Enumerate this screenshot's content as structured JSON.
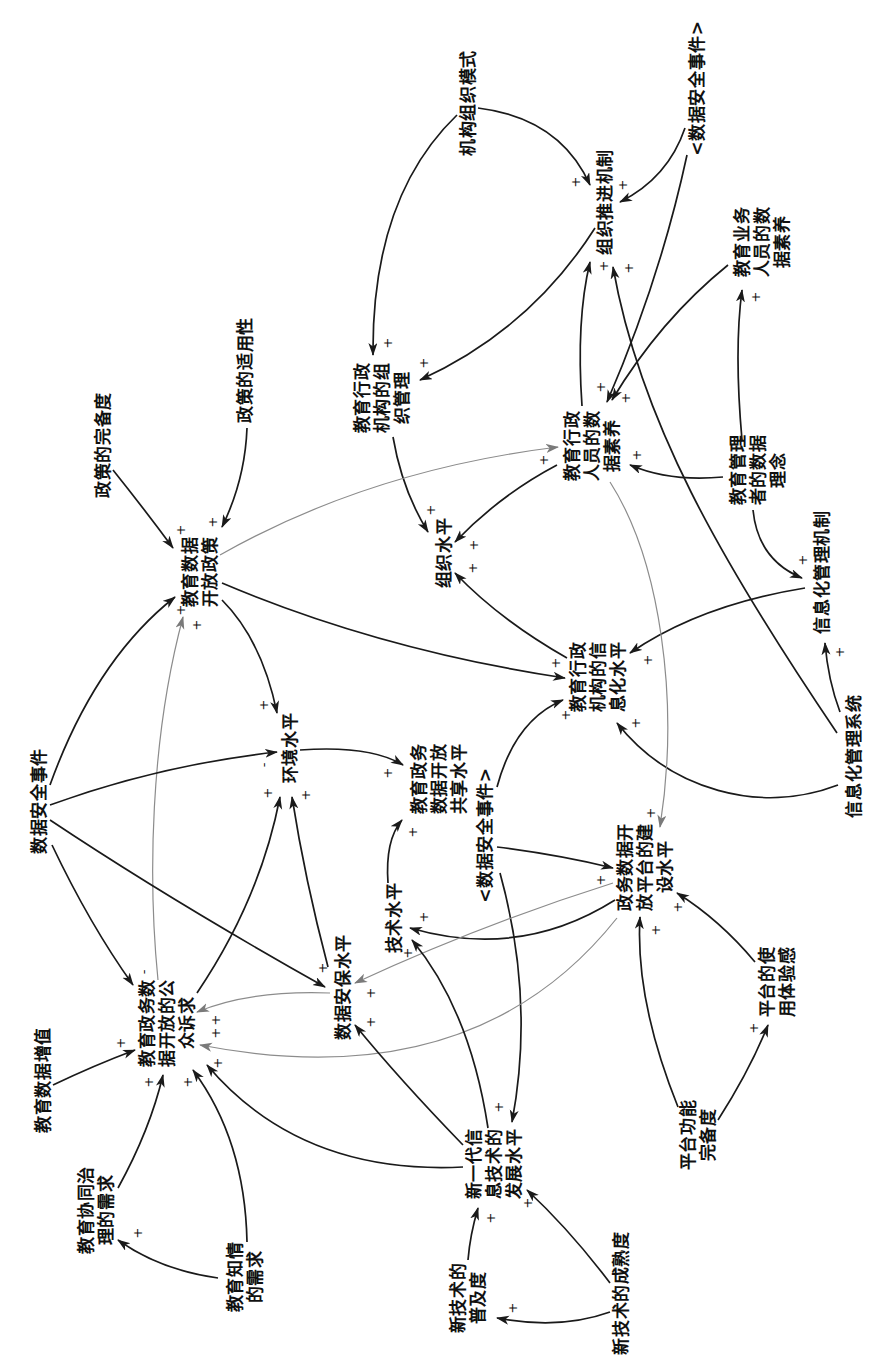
{
  "colors": {
    "background": "#ffffff",
    "text": "#111111",
    "link_primary": "#1a1a1a",
    "link_secondary": "#8c8c8c"
  },
  "diagram": {
    "nodes": [
      {
        "label": "机构组织模式",
        "lines": [
          "机构组织模式"
        ]
      },
      {
        "label": "<数据安全事件>",
        "lines": [
          "<数据安全事件>"
        ]
      },
      {
        "label": "组织推进机制",
        "lines": [
          "组织推进机制"
        ]
      },
      {
        "label": "教育业务人员的数据素养",
        "lines": [
          "教育业务",
          "人员的数",
          "据素养"
        ]
      },
      {
        "label": "教育行政机构的组织管理",
        "lines": [
          "教育行政",
          "机构的组",
          "织管理"
        ]
      },
      {
        "label": "教育行政人员的数据素养",
        "lines": [
          "教育行政",
          "人员的数",
          "据素养"
        ]
      },
      {
        "label": "教育管理者的数据理念",
        "lines": [
          "教育管理",
          "者的数据",
          "理念"
        ]
      },
      {
        "label": "政策的适用性",
        "lines": [
          "政策的适用性"
        ]
      },
      {
        "label": "政策的完备度",
        "lines": [
          "政策的完备度"
        ]
      },
      {
        "label": "教育数据开放政策",
        "lines": [
          "教育数据",
          "开放政策"
        ]
      },
      {
        "label": "组织水平",
        "lines": [
          "组织水平"
        ]
      },
      {
        "label": "信息化管理机制",
        "lines": [
          "信息化管理机制"
        ]
      },
      {
        "label": "教育行政机构的信息化水平",
        "lines": [
          "教育行政",
          "机构的信",
          "息化水平"
        ]
      },
      {
        "label": "信息化管理系统",
        "lines": [
          "信息化管理系统"
        ]
      },
      {
        "label": "数据安全事件",
        "lines": [
          "数据安全事件"
        ]
      },
      {
        "label": "环境水平",
        "lines": [
          "环境水平"
        ]
      },
      {
        "label": "教育政务数据开放共享水平",
        "lines": [
          "教育政务",
          "数据开放",
          "共享水平"
        ]
      },
      {
        "label": "<数据安全事件>",
        "lines": [
          "<数据安全事件>"
        ]
      },
      {
        "label": "政务数据开放平台的建设水平",
        "lines": [
          "政务数据开",
          "放平台的建",
          "设水平"
        ]
      },
      {
        "label": "技术水平",
        "lines": [
          "技术水平"
        ]
      },
      {
        "label": "数据安保水平",
        "lines": [
          "数据安保水平"
        ]
      },
      {
        "label": "教育政务数据开放的公众诉求",
        "lines": [
          "教育政务数",
          "据开放的公",
          "众诉求"
        ]
      },
      {
        "label": "教育数据增值",
        "lines": [
          "教育数据增值"
        ]
      },
      {
        "label": "教育协同治理的需求",
        "lines": [
          "教育协同治",
          "理的需求"
        ]
      },
      {
        "label": "教育知情的需求",
        "lines": [
          "教育知情",
          "的需求"
        ]
      },
      {
        "label": "新一代信息技术的发展水平",
        "lines": [
          "新一代信",
          "息技术的",
          "发展水平"
        ]
      },
      {
        "label": "新技术的普及度",
        "lines": [
          "新技术的",
          "普及度"
        ]
      },
      {
        "label": "新技术的成熟度",
        "lines": [
          "新技术的成熟度"
        ]
      },
      {
        "label": "平台功能完备度",
        "lines": [
          "平台功能",
          "完备度"
        ]
      },
      {
        "label": "平台的使用体验感",
        "lines": [
          "平台的使",
          "用体验感"
        ]
      }
    ],
    "edges": [
      {
        "from": "机构组织模式",
        "to": "组织推进机制",
        "polarity": "+",
        "style": "black"
      },
      {
        "from": "机构组织模式",
        "to": "教育行政机构的组织管理",
        "polarity": "+",
        "style": "black"
      },
      {
        "from": "<数据安全事件>",
        "to": "组织推进机制",
        "polarity": "+",
        "style": "black"
      },
      {
        "from": "<数据安全事件>",
        "to": "教育行政人员的数据素养",
        "polarity": "+",
        "style": "black"
      },
      {
        "from": "组织推进机制",
        "to": "教育行政机构的组织管理",
        "polarity": "+",
        "style": "black"
      },
      {
        "from": "教育业务人员的数据素养",
        "to": "教育行政人员的数据素养",
        "polarity": "+",
        "style": "black"
      },
      {
        "from": "教育行政人员的数据素养",
        "to": "组织推进机制",
        "polarity": "+",
        "style": "black"
      },
      {
        "from": "信息化管理系统",
        "to": "组织推进机制",
        "polarity": "+",
        "style": "black"
      },
      {
        "from": "教育管理者的数据理念",
        "to": "教育业务人员的数据素养",
        "polarity": "+",
        "style": "black"
      },
      {
        "from": "教育管理者的数据理念",
        "to": "教育行政人员的数据素养",
        "polarity": "+",
        "style": "black"
      },
      {
        "from": "教育管理者的数据理念",
        "to": "信息化管理机制",
        "polarity": "+",
        "style": "black"
      },
      {
        "from": "信息化管理系统",
        "to": "信息化管理机制",
        "polarity": "+",
        "style": "black"
      },
      {
        "from": "信息化管理机制",
        "to": "教育行政机构的信息化水平",
        "polarity": "+",
        "style": "black"
      },
      {
        "from": "信息化管理系统",
        "to": "教育行政机构的信息化水平",
        "polarity": "+",
        "style": "black"
      },
      {
        "from": "教育行政机构的组织管理",
        "to": "组织水平",
        "polarity": "+",
        "style": "black"
      },
      {
        "from": "教育行政人员的数据素养",
        "to": "组织水平",
        "polarity": "+",
        "style": "black"
      },
      {
        "from": "教育行政机构的信息化水平",
        "to": "组织水平",
        "polarity": "+",
        "style": "black"
      },
      {
        "from": "教育数据开放政策",
        "to": "教育行政人员的数据素养",
        "polarity": "+",
        "style": "gray"
      },
      {
        "from": "教育数据开放政策",
        "to": "教育行政机构的信息化水平",
        "polarity": "+",
        "style": "black"
      },
      {
        "from": "教育数据开放政策",
        "to": "环境水平",
        "polarity": "+",
        "style": "black"
      },
      {
        "from": "政策的完备度",
        "to": "教育数据开放政策",
        "polarity": "+",
        "style": "black"
      },
      {
        "from": "政策的适用性",
        "to": "教育数据开放政策",
        "polarity": "+",
        "style": "black"
      },
      {
        "from": "数据安全事件",
        "to": "教育数据开放政策",
        "polarity": "+",
        "style": "black"
      },
      {
        "from": "教育政务数据开放的公众诉求",
        "to": "教育数据开放政策",
        "polarity": "+",
        "style": "gray"
      },
      {
        "from": "数据安全事件",
        "to": "环境水平",
        "polarity": "-",
        "style": "black"
      },
      {
        "from": "数据安全事件",
        "to": "数据安保水平",
        "polarity": "+",
        "style": "black"
      },
      {
        "from": "数据安全事件",
        "to": "教育政务数据开放的公众诉求",
        "polarity": "-",
        "style": "black"
      },
      {
        "from": "教育政务数据开放的公众诉求",
        "to": "环境水平",
        "polarity": "+",
        "style": "black"
      },
      {
        "from": "数据安保水平",
        "to": "环境水平",
        "polarity": "+",
        "style": "black"
      },
      {
        "from": "环境水平",
        "to": "教育政务数据开放共享水平",
        "polarity": "+",
        "style": "black"
      },
      {
        "from": "数据安保水平",
        "to": "教育政务数据开放的公众诉求",
        "polarity": "+",
        "style": "gray"
      },
      {
        "from": "技术水平",
        "to": "教育政务数据开放共享水平",
        "polarity": "+",
        "style": "black"
      },
      {
        "from": "<数据安全事件>",
        "to": "教育行政机构的信息化水平",
        "polarity": "+",
        "style": "black"
      },
      {
        "from": "<数据安全事件>",
        "to": "政务数据开放平台的建设水平",
        "polarity": "+",
        "style": "black"
      },
      {
        "from": "<数据安全事件>",
        "to": "新一代信息技术的发展水平",
        "polarity": "+",
        "style": "black"
      },
      {
        "from": "教育行政人员的数据素养",
        "to": "政务数据开放平台的建设水平",
        "polarity": "+",
        "style": "gray"
      },
      {
        "from": "政务数据开放平台的建设水平",
        "to": "技术水平",
        "polarity": "+",
        "style": "black"
      },
      {
        "from": "政务数据开放平台的建设水平",
        "to": "数据安保水平",
        "polarity": "+",
        "style": "gray"
      },
      {
        "from": "政务数据开放平台的建设水平",
        "to": "教育政务数据开放的公众诉求",
        "polarity": "+",
        "style": "gray"
      },
      {
        "from": "新一代信息技术的发展水平",
        "to": "技术水平",
        "polarity": "+",
        "style": "black"
      },
      {
        "from": "新一代信息技术的发展水平",
        "to": "数据安保水平",
        "polarity": "+",
        "style": "black"
      },
      {
        "from": "新一代信息技术的发展水平",
        "to": "教育政务数据开放的公众诉求",
        "polarity": "+",
        "style": "black"
      },
      {
        "from": "平台功能完备度",
        "to": "政务数据开放平台的建设水平",
        "polarity": "+",
        "style": "black"
      },
      {
        "from": "平台的使用体验感",
        "to": "政务数据开放平台的建设水平",
        "polarity": "+",
        "style": "black"
      },
      {
        "from": "平台功能完备度",
        "to": "平台的使用体验感",
        "polarity": "+",
        "style": "black"
      },
      {
        "from": "新技术的普及度",
        "to": "新一代信息技术的发展水平",
        "polarity": "+",
        "style": "black"
      },
      {
        "from": "新技术的成熟度",
        "to": "新一代信息技术的发展水平",
        "polarity": "+",
        "style": "black"
      },
      {
        "from": "新技术的成熟度",
        "to": "新技术的普及度",
        "polarity": "+",
        "style": "black"
      },
      {
        "from": "教育数据增值",
        "to": "教育政务数据开放的公众诉求",
        "polarity": "+",
        "style": "black"
      },
      {
        "from": "教育协同治理的需求",
        "to": "教育政务数据开放的公众诉求",
        "polarity": "+",
        "style": "black"
      },
      {
        "from": "教育知情的需求",
        "to": "教育政务数据开放的公众诉求",
        "polarity": "+",
        "style": "black"
      },
      {
        "from": "教育知情的需求",
        "to": "教育协同治理的需求",
        "polarity": "+",
        "style": "black"
      }
    ]
  }
}
